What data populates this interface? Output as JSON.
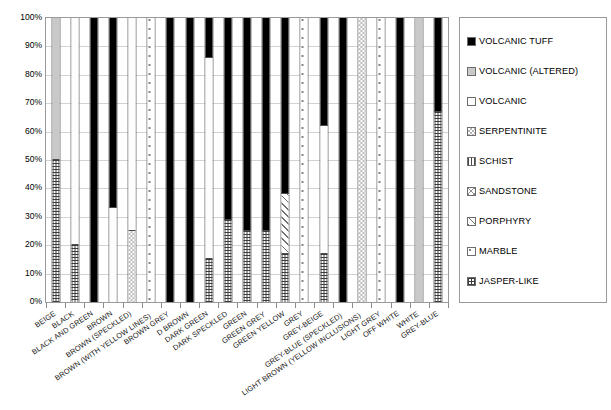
{
  "chart_data": {
    "type": "bar",
    "subtype": "stacked-percentage",
    "title": "",
    "xlabel": "",
    "ylabel": "",
    "ylim": [
      0,
      100
    ],
    "ytick_labels": [
      "100%",
      "90%",
      "80%",
      "70%",
      "60%",
      "50%",
      "40%",
      "30%",
      "20%",
      "10%",
      "0%"
    ],
    "ytick_values": [
      100,
      90,
      80,
      70,
      60,
      50,
      40,
      30,
      20,
      10,
      0
    ],
    "grid": true,
    "legend_position": "right",
    "categories": [
      "BEIGE",
      "BLACK",
      "BLACK AND GREEN",
      "BROWN",
      "BROWN (SPECKLED)",
      "BROWN (WITH YELLOW LINES)",
      "BROWN GREY",
      "D BROWN",
      "DARK GREEN",
      "DARK SPECKLED",
      "GREEN",
      "GREEN GREY",
      "GREEN YELLOW",
      "GREY",
      "GREY-BEIGE",
      "GREY-BLUE (SPECKLED)",
      "LIGHT BROWN (YELLOW INCLUSIONS)",
      "LIGHT GREY",
      "OFF WHITE",
      "WHITE",
      "GREY-BLUE"
    ],
    "series": [
      {
        "name": "VOLCANIC TUFF",
        "key": "tuff",
        "pattern": "solid-black",
        "values": [
          0,
          0,
          100,
          67,
          0,
          0,
          100,
          100,
          14,
          71,
          75,
          75,
          62,
          0,
          38,
          100,
          0,
          0,
          100,
          0,
          33
        ]
      },
      {
        "name": "VOLCANIC (ALTERED)",
        "key": "valt",
        "pattern": "solid-grey",
        "values": [
          50,
          0,
          0,
          0,
          0,
          0,
          0,
          0,
          0,
          0,
          0,
          0,
          0,
          0,
          0,
          0,
          0,
          0,
          0,
          100,
          0
        ]
      },
      {
        "name": "VOLCANIC",
        "key": "volc",
        "pattern": "fine-dots",
        "values": [
          0,
          80,
          0,
          33,
          75,
          0,
          0,
          0,
          71,
          0,
          0,
          0,
          0,
          0,
          45,
          0,
          0,
          0,
          0,
          0,
          0
        ]
      },
      {
        "name": "SERPENTINITE",
        "key": "serp",
        "pattern": "checker",
        "values": [
          0,
          0,
          0,
          0,
          25,
          0,
          0,
          0,
          0,
          0,
          0,
          0,
          0,
          0,
          0,
          0,
          100,
          0,
          0,
          0,
          0
        ]
      },
      {
        "name": "SCHIST",
        "key": "schist",
        "pattern": "vertical-lines",
        "values": [
          0,
          0,
          0,
          0,
          0,
          0,
          0,
          0,
          0,
          0,
          0,
          0,
          0,
          0,
          0,
          0,
          0,
          0,
          0,
          0,
          0
        ]
      },
      {
        "name": "SANDSTONE",
        "key": "sand",
        "pattern": "cross-diagonal",
        "values": [
          0,
          0,
          0,
          0,
          0,
          0,
          0,
          0,
          0,
          0,
          0,
          0,
          0,
          0,
          0,
          0,
          0,
          0,
          0,
          0,
          0
        ]
      },
      {
        "name": "PORPHYRY",
        "key": "porph",
        "pattern": "diagonal-hatch",
        "values": [
          0,
          0,
          0,
          0,
          0,
          0,
          0,
          0,
          0,
          0,
          0,
          0,
          21,
          0,
          0,
          0,
          0,
          0,
          0,
          0,
          0
        ]
      },
      {
        "name": "MARBLE",
        "key": "marble",
        "pattern": "sparse-dots",
        "values": [
          0,
          0,
          0,
          0,
          0,
          100,
          0,
          0,
          0,
          0,
          0,
          0,
          0,
          100,
          0,
          0,
          0,
          100,
          0,
          0,
          0
        ]
      },
      {
        "name": "JASPER-LIKE",
        "key": "jasper",
        "pattern": "grid-crosshatch",
        "values": [
          50,
          20,
          0,
          0,
          0,
          0,
          0,
          0,
          15,
          29,
          25,
          25,
          17,
          0,
          17,
          0,
          0,
          0,
          0,
          0,
          67
        ]
      }
    ],
    "stack_order_bottom_to_top": [
      "jasper",
      "marble",
      "porph",
      "sand",
      "schist",
      "serp",
      "volc",
      "valt",
      "tuff"
    ],
    "bar_stacks": [
      [
        {
          "key": "jasper",
          "v": 50
        },
        {
          "key": "valt",
          "v": 50
        }
      ],
      [
        {
          "key": "jasper",
          "v": 20
        },
        {
          "key": "volc",
          "v": 80
        }
      ],
      [
        {
          "key": "tuff",
          "v": 100
        }
      ],
      [
        {
          "key": "volc",
          "v": 33
        },
        {
          "key": "tuff",
          "v": 67
        }
      ],
      [
        {
          "key": "serp",
          "v": 25
        },
        {
          "key": "volc",
          "v": 75
        }
      ],
      [
        {
          "key": "marble",
          "v": 100
        }
      ],
      [
        {
          "key": "tuff",
          "v": 100
        }
      ],
      [
        {
          "key": "tuff",
          "v": 100
        }
      ],
      [
        {
          "key": "jasper",
          "v": 15
        },
        {
          "key": "volc",
          "v": 71
        },
        {
          "key": "tuff",
          "v": 14
        }
      ],
      [
        {
          "key": "jasper",
          "v": 29
        },
        {
          "key": "tuff",
          "v": 71
        }
      ],
      [
        {
          "key": "jasper",
          "v": 25
        },
        {
          "key": "tuff",
          "v": 75
        }
      ],
      [
        {
          "key": "jasper",
          "v": 25
        },
        {
          "key": "tuff",
          "v": 75
        }
      ],
      [
        {
          "key": "jasper",
          "v": 17
        },
        {
          "key": "porph",
          "v": 21
        },
        {
          "key": "tuff",
          "v": 62
        }
      ],
      [
        {
          "key": "marble",
          "v": 100
        }
      ],
      [
        {
          "key": "jasper",
          "v": 17
        },
        {
          "key": "volc",
          "v": 45
        },
        {
          "key": "tuff",
          "v": 38
        }
      ],
      [
        {
          "key": "tuff",
          "v": 100
        }
      ],
      [
        {
          "key": "serp",
          "v": 100
        }
      ],
      [
        {
          "key": "marble",
          "v": 100
        }
      ],
      [
        {
          "key": "tuff",
          "v": 100
        }
      ],
      [
        {
          "key": "valt",
          "v": 100
        }
      ],
      [
        {
          "key": "jasper",
          "v": 67
        },
        {
          "key": "tuff",
          "v": 33
        }
      ]
    ]
  },
  "legend": {
    "items": [
      {
        "label": "VOLCANIC TUFF",
        "key": "tuff"
      },
      {
        "label": "VOLCANIC (ALTERED)",
        "key": "valt"
      },
      {
        "label": "VOLCANIC",
        "key": "volc"
      },
      {
        "label": "SERPENTINITE",
        "key": "serp"
      },
      {
        "label": "SCHIST",
        "key": "schist"
      },
      {
        "label": "SANDSTONE",
        "key": "sand"
      },
      {
        "label": "PORPHYRY",
        "key": "porph"
      },
      {
        "label": "MARBLE",
        "key": "marble"
      },
      {
        "label": "JASPER-LIKE",
        "key": "jasper"
      }
    ]
  },
  "colors": {
    "tuff": "#000000",
    "valt": "#c9c9c9",
    "background": "#ffffff",
    "axis": "#9a9a9a",
    "grid": "#d2d2d2",
    "text": "#000000"
  }
}
